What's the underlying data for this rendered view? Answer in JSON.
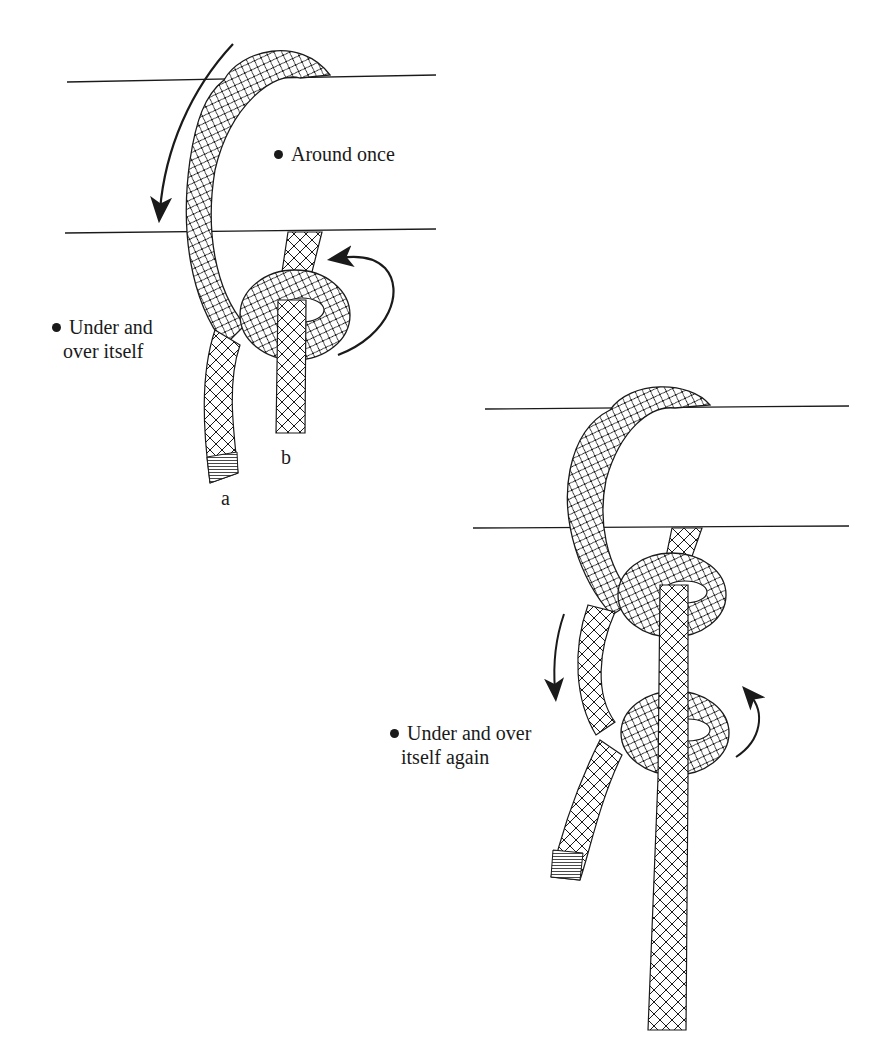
{
  "figure": {
    "panel_1": {
      "labels": {
        "around_once": "Around once",
        "under_over_line1": "Under and",
        "under_over_line2": "over itself",
        "end_a": "a",
        "end_b": "b"
      }
    },
    "panel_2": {
      "labels": {
        "under_over_again_line1": "Under and over",
        "under_over_again_line2": "itself again"
      }
    },
    "colors": {
      "ink": "#1a1a1a",
      "background": "#ffffff"
    }
  }
}
